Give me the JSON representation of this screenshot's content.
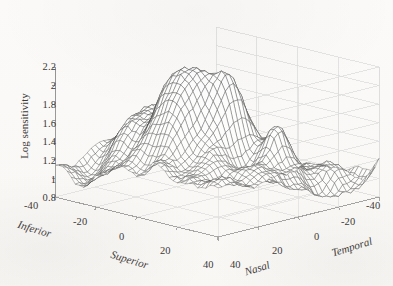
{
  "figure": {
    "kind": "3d-mesh-surface-plot",
    "background_color": "#fbfaf8",
    "mesh_color": "#2b2b2b",
    "grid_color": "#d9d9d9",
    "axis_color": "#8a8a8a"
  },
  "chart_data": {
    "type": "surface",
    "title": "",
    "subtitle": "",
    "xlabel_left": "Inferior",
    "xlabel_right": "Superior",
    "ylabel_left": "Nasal",
    "ylabel_right": "Temporal",
    "zlabel": "Log sensitivity",
    "grid": true,
    "legend": "none",
    "projection": "3d-wireframe-mesh",
    "zlim": [
      0.8,
      2.2
    ],
    "zticks": [
      "0.8",
      "1",
      "1.2",
      "1.4",
      "1.6",
      "1.8",
      "2",
      "2.2"
    ],
    "ztick_values": [
      0.8,
      1.0,
      1.2,
      1.4,
      1.6,
      1.8,
      2.0,
      2.2
    ],
    "xlim": [
      -40,
      40
    ],
    "xticks": [
      "-40",
      "-20",
      "0",
      "20",
      "40"
    ],
    "xtick_values": [
      -40,
      -20,
      0,
      20,
      40
    ],
    "ylim": [
      -40,
      40
    ],
    "yticks": [
      "40",
      "20",
      "0",
      "-20",
      "-40"
    ],
    "ytick_values": [
      40,
      20,
      0,
      -20,
      -40
    ],
    "x_axis_direction": "Inferior to Superior",
    "y_axis_direction": "Nasal to Temporal",
    "surface_description": "Irregular multi-peak retinal log sensitivity surface with dense wireframe mesh; highest ridge near the Nasal-Superior mid field reaching about 2.25, broad depression dropping to about 0.8 toward the front Nasal-Superior corner, and a narrow isolated spur near the Temporal edge.",
    "z_peak_approx": 2.25,
    "z_valley_approx": 0.8,
    "mesh_rows": 41,
    "mesh_cols": 41
  },
  "axes": {
    "z_ticks": [
      {
        "label": "2.2",
        "value": 2.2
      },
      {
        "label": "2",
        "value": 2.0
      },
      {
        "label": "1.8",
        "value": 1.8
      },
      {
        "label": "1.6",
        "value": 1.6
      },
      {
        "label": "1.4",
        "value": 1.4
      },
      {
        "label": "1.2",
        "value": 1.2
      },
      {
        "label": "1",
        "value": 1.0
      },
      {
        "label": "0.8",
        "value": 0.8
      }
    ],
    "x_ticks": [
      {
        "label": "-40",
        "value": -40
      },
      {
        "label": "-20",
        "value": -20
      },
      {
        "label": "0",
        "value": 0
      },
      {
        "label": "20",
        "value": 20
      },
      {
        "label": "40",
        "value": 40
      }
    ],
    "y_ticks": [
      {
        "label": "40",
        "value": 40
      },
      {
        "label": "20",
        "value": 20
      },
      {
        "label": "0",
        "value": 0
      },
      {
        "label": "-20",
        "value": -20
      },
      {
        "label": "-40",
        "value": -40
      }
    ],
    "names": {
      "z": "Log sensitivity",
      "x_near": "Inferior",
      "x_far": "Superior",
      "y_near": "Nasal",
      "y_far": "Temporal"
    }
  }
}
